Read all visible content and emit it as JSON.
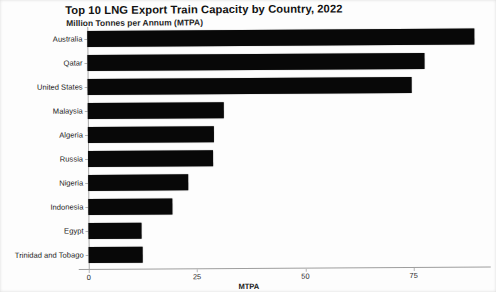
{
  "chart_data": {
    "type": "bar",
    "orientation": "horizontal",
    "title": "Top 10 LNG Export Train Capacity by Country, 2022",
    "subtitle": "Million Tonnes per Annum (MTPA)",
    "xlabel": "MTPA",
    "ylabel": "",
    "categories": [
      "Australia",
      "Qatar",
      "United States",
      "Malaysia",
      "Algeria",
      "Russia",
      "Nigeria",
      "Indonesia",
      "Egypt",
      "Trinidad and Tobago"
    ],
    "values": [
      89.4,
      77.8,
      74.8,
      31.4,
      29.2,
      28.9,
      23.0,
      19.4,
      12.2,
      12.5
    ],
    "xticks": [
      0,
      25,
      50,
      75
    ],
    "xtick_labels": [
      "0",
      "25",
      "50",
      "75"
    ],
    "xlim": [
      0,
      92.8
    ],
    "grid": false,
    "legend": false,
    "bar_color": "#080808"
  },
  "style": {
    "axis_color": "#a9a9a9",
    "text_color": "#1a1a1a",
    "page_background": "#fdfdfd"
  }
}
